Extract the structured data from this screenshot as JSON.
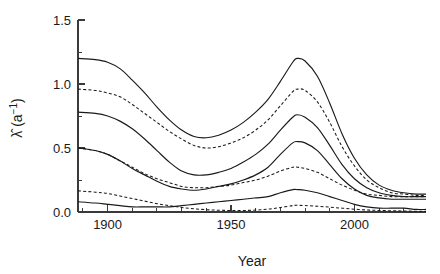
{
  "chart_data": {
    "type": "line",
    "title": "",
    "subtitle": "",
    "xlabel": "Year",
    "ylabel": "λ̂ (a⁻¹)",
    "ylabel_parts": {
      "symbol": "λ̂",
      "units_open": " (a",
      "units_exp": "−1",
      "units_close": ")"
    },
    "xlim": [
      1888,
      2029
    ],
    "ylim": [
      0.0,
      1.5
    ],
    "xticks": [
      1900,
      1950,
      2000
    ],
    "xtick_labels": [
      "1900",
      "1950",
      "2000"
    ],
    "xticks_minor": [
      1890,
      1910,
      1920,
      1930,
      1940,
      1960,
      1970,
      1980,
      1990,
      2010,
      2020
    ],
    "yticks": [
      0.0,
      0.5,
      1.0,
      1.5
    ],
    "ytick_labels": [
      "0.0",
      "0.5",
      "1.0",
      "1.5"
    ],
    "yticks_minor": [
      0.25,
      0.75,
      1.25
    ],
    "grid": false,
    "legend": "none",
    "line_color": "#1a1a1a",
    "axis_color": "#3a3a3a",
    "background": "#ffffff",
    "x": [
      1888,
      1895,
      1900,
      1905,
      1910,
      1915,
      1920,
      1925,
      1930,
      1935,
      1940,
      1945,
      1950,
      1955,
      1960,
      1965,
      1970,
      1975,
      1977,
      1980,
      1985,
      1990,
      1995,
      2000,
      2005,
      2010,
      2015,
      2020,
      2025,
      2029
    ],
    "series": [
      {
        "name": "upper-outer-solid",
        "style": "solid",
        "values": [
          1.2,
          1.19,
          1.17,
          1.12,
          1.03,
          0.93,
          0.82,
          0.72,
          0.64,
          0.59,
          0.58,
          0.6,
          0.64,
          0.7,
          0.78,
          0.88,
          1.02,
          1.17,
          1.2,
          1.18,
          1.06,
          0.85,
          0.61,
          0.42,
          0.29,
          0.21,
          0.17,
          0.15,
          0.14,
          0.14
        ]
      },
      {
        "name": "upper-inner-dashed",
        "style": "dashed",
        "values": [
          0.96,
          0.95,
          0.93,
          0.9,
          0.84,
          0.77,
          0.7,
          0.63,
          0.57,
          0.52,
          0.5,
          0.51,
          0.54,
          0.58,
          0.64,
          0.72,
          0.83,
          0.94,
          0.96,
          0.95,
          0.86,
          0.7,
          0.51,
          0.36,
          0.25,
          0.19,
          0.15,
          0.14,
          0.13,
          0.13
        ]
      },
      {
        "name": "mid-upper-solid",
        "style": "solid",
        "values": [
          0.78,
          0.77,
          0.75,
          0.71,
          0.65,
          0.57,
          0.48,
          0.39,
          0.32,
          0.29,
          0.29,
          0.31,
          0.34,
          0.39,
          0.45,
          0.53,
          0.64,
          0.74,
          0.76,
          0.74,
          0.66,
          0.52,
          0.37,
          0.26,
          0.19,
          0.15,
          0.13,
          0.12,
          0.12,
          0.12
        ]
      },
      {
        "name": "mid-lower-solid",
        "style": "solid",
        "values": [
          0.5,
          0.48,
          0.45,
          0.4,
          0.34,
          0.29,
          0.24,
          0.2,
          0.18,
          0.17,
          0.18,
          0.2,
          0.22,
          0.25,
          0.29,
          0.35,
          0.45,
          0.54,
          0.55,
          0.54,
          0.48,
          0.37,
          0.26,
          0.18,
          0.13,
          0.11,
          0.1,
          0.1,
          0.1,
          0.1
        ]
      },
      {
        "name": "mid-lower-dashed",
        "style": "dashed",
        "values": [
          0.5,
          0.48,
          0.45,
          0.4,
          0.35,
          0.3,
          0.26,
          0.23,
          0.2,
          0.19,
          0.19,
          0.2,
          0.21,
          0.23,
          0.25,
          0.28,
          0.32,
          0.35,
          0.35,
          0.34,
          0.31,
          0.26,
          0.21,
          0.17,
          0.14,
          0.13,
          0.12,
          0.12,
          0.12,
          0.12
        ]
      },
      {
        "name": "low-solid",
        "style": "solid",
        "values": [
          0.08,
          0.07,
          0.06,
          0.05,
          0.04,
          0.04,
          0.04,
          0.04,
          0.05,
          0.06,
          0.07,
          0.08,
          0.09,
          0.1,
          0.11,
          0.12,
          0.15,
          0.175,
          0.175,
          0.17,
          0.15,
          0.12,
          0.09,
          0.06,
          0.04,
          0.03,
          0.03,
          0.03,
          0.02,
          0.02
        ]
      },
      {
        "name": "low-dashed",
        "style": "dashed",
        "values": [
          0.165,
          0.155,
          0.145,
          0.125,
          0.105,
          0.085,
          0.065,
          0.05,
          0.035,
          0.025,
          0.018,
          0.014,
          0.012,
          0.012,
          0.015,
          0.022,
          0.035,
          0.05,
          0.052,
          0.05,
          0.045,
          0.038,
          0.03,
          0.022,
          0.016,
          0.012,
          0.01,
          0.008,
          0.006,
          0.005
        ]
      }
    ]
  }
}
